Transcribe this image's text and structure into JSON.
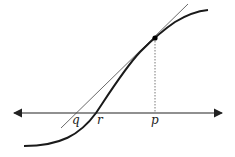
{
  "diagram": {
    "type": "tangent-line-newton-method",
    "labels": {
      "q": "q",
      "r": "r",
      "p": "p"
    },
    "colors": {
      "curve": "#1a1a1a",
      "tangent": "#444444",
      "axis": "#222222",
      "point": "#000000"
    }
  }
}
